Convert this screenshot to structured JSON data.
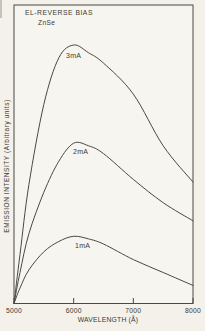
{
  "chart_data": {
    "type": "line",
    "title": "EL-REVERSE BIAS",
    "subtitle": "ZnSe",
    "xlabel": "WAVELENGTH (Å)",
    "ylabel": "EMISSION INTENSITY (Arbitrary units)",
    "xlim": [
      5000,
      8000
    ],
    "ylim": [
      0,
      105
    ],
    "x_ticks": [
      5000,
      6000,
      7000,
      8000
    ],
    "y_ticks": [],
    "grid": false,
    "legend": "inline curve labels",
    "x": [
      5000,
      5100,
      5250,
      5500,
      5750,
      6000,
      6250,
      6500,
      7000,
      7500,
      8000
    ],
    "series": [
      {
        "name": "3mA",
        "values": [
          0,
          19,
          46,
          77,
          95,
          100,
          97,
          93,
          81,
          61,
          47
        ]
      },
      {
        "name": "2mA",
        "values": [
          0,
          12,
          27,
          43,
          55,
          62,
          61,
          58,
          48,
          39,
          32
        ]
      },
      {
        "name": "1mA",
        "values": [
          0,
          6,
          13,
          20,
          24,
          26,
          25,
          23,
          17,
          12,
          7
        ]
      }
    ],
    "y_units": "arbitrary units, normalized to 3mA peak = 100"
  },
  "colors": {
    "paper": "#f3f1ea",
    "plot_background": "#f7f5ef",
    "curve_line": "#4b4842",
    "text": "#3c3a34"
  }
}
